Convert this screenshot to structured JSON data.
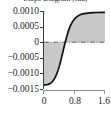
{
  "chart_data": {
    "type": "line",
    "title": "Slope Diagram (rad)",
    "title_clipped": true,
    "xlabel": "",
    "ylabel": "",
    "xlim": [
      0,
      1.6
    ],
    "ylim": [
      -0.0015,
      0.001
    ],
    "grid": false,
    "legend": null,
    "zero_reference_line": {
      "value": 0,
      "style": "dash-dot",
      "color": "#555555"
    },
    "fill": {
      "between": "curve-and-zero",
      "color": "#c9c9c9"
    },
    "line_color": "#111111",
    "y_ticks": [
      0.001,
      0.0005,
      0,
      -0.0005,
      -0.001,
      -0.0015
    ],
    "y_tick_labels": [
      "0.0010",
      "0.0005",
      "0",
      "−0.0005",
      "−0.0010",
      "−0.0015"
    ],
    "x_ticks": [
      0,
      0.8,
      1.6
    ],
    "x_tick_labels": [
      "0",
      "0.8",
      "1.6"
    ],
    "series": [
      {
        "name": "slope",
        "x": [
          0.0,
          0.05,
          0.1,
          0.15,
          0.2,
          0.25,
          0.3,
          0.35,
          0.4,
          0.45,
          0.5,
          0.55,
          0.6,
          0.65,
          0.7,
          0.75,
          0.8,
          0.85,
          0.9,
          0.95,
          1.0,
          1.1,
          1.2,
          1.3,
          1.4,
          1.5,
          1.6
        ],
        "y": [
          -0.00137,
          -0.001368,
          -0.001355,
          -0.00133,
          -0.001285,
          -0.001215,
          -0.00111,
          -0.000965,
          -0.000775,
          -0.000545,
          -0.00029,
          -3.5e-05,
          0.0002,
          0.000395,
          0.000545,
          0.00066,
          0.000745,
          0.000805,
          0.00085,
          0.00088,
          0.0009,
          0.000925,
          0.00094,
          0.000948,
          0.000952,
          0.000954,
          0.000955
        ]
      }
    ]
  },
  "axes": {
    "y_labels": [
      "0.0010",
      "0.0005",
      "0",
      "−0.0005",
      "−0.0010",
      "−0.0015"
    ],
    "x_labels": [
      "0",
      "0.8",
      "1.6"
    ]
  },
  "colors": {
    "line": "#111111",
    "fill": "#c9c9c9",
    "axis": "#3a3a3a",
    "x_axis": "#8f8f8f",
    "zero_line": "#555555",
    "background": "#ffffff"
  }
}
